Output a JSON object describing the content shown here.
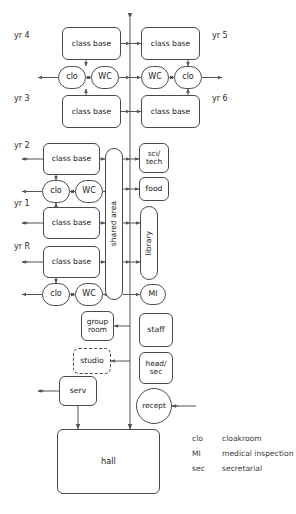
{
  "diagram": {
    "year_labels": [
      {
        "id": "yr4",
        "text": "yr 4",
        "x": 14,
        "y": 31
      },
      {
        "id": "yr3",
        "text": "yr 3",
        "x": 14,
        "y": 94
      },
      {
        "id": "yr2",
        "text": "yr 2",
        "x": 14,
        "y": 141
      },
      {
        "id": "yr1",
        "text": "yr 1",
        "x": 14,
        "y": 199
      },
      {
        "id": "yrR",
        "text": "yr R",
        "x": 14,
        "y": 242
      },
      {
        "id": "yr5",
        "text": "yr 5",
        "x": 212,
        "y": 31
      },
      {
        "id": "yr6",
        "text": "yr 6",
        "x": 212,
        "y": 94
      }
    ],
    "nodes": [
      {
        "id": "classbase-yr4",
        "label": "class base",
        "shape": "rect",
        "x": 62,
        "y": 27,
        "w": 59,
        "h": 33,
        "font": 7.6
      },
      {
        "id": "classbase-yr5",
        "label": "class base",
        "shape": "rect",
        "x": 141,
        "y": 27,
        "w": 59,
        "h": 33,
        "font": 7.6
      },
      {
        "id": "clo-yr4",
        "label": "clo",
        "shape": "pill",
        "x": 58,
        "y": 66,
        "w": 28,
        "h": 23,
        "font": 8
      },
      {
        "id": "wc-left-top",
        "label": "WC",
        "shape": "pill",
        "x": 91,
        "y": 66,
        "w": 28,
        "h": 23,
        "font": 8
      },
      {
        "id": "wc-right-top",
        "label": "WC",
        "shape": "pill",
        "x": 141,
        "y": 66,
        "w": 28,
        "h": 23,
        "font": 8
      },
      {
        "id": "clo-yr5",
        "label": "clo",
        "shape": "pill",
        "x": 174,
        "y": 66,
        "w": 28,
        "h": 23,
        "font": 8
      },
      {
        "id": "classbase-yr3",
        "label": "class base",
        "shape": "rect",
        "x": 62,
        "y": 95,
        "w": 59,
        "h": 33,
        "font": 7.6
      },
      {
        "id": "classbase-yr6",
        "label": "class base",
        "shape": "rect",
        "x": 141,
        "y": 95,
        "w": 59,
        "h": 33,
        "font": 7.6
      },
      {
        "id": "classbase-yr2",
        "label": "class base",
        "shape": "rect",
        "x": 43,
        "y": 143,
        "w": 57,
        "h": 32,
        "font": 7.6
      },
      {
        "id": "clo-yr2",
        "label": "clo",
        "shape": "pill",
        "x": 42,
        "y": 180,
        "w": 28,
        "h": 23,
        "font": 8
      },
      {
        "id": "wc-yr2",
        "label": "WC",
        "shape": "pill",
        "x": 75,
        "y": 180,
        "w": 28,
        "h": 23,
        "font": 8
      },
      {
        "id": "classbase-yr1",
        "label": "class base",
        "shape": "rect",
        "x": 43,
        "y": 207,
        "w": 57,
        "h": 32,
        "font": 7.6
      },
      {
        "id": "classbase-yrR",
        "label": "class base",
        "shape": "rect",
        "x": 43,
        "y": 246,
        "w": 57,
        "h": 32,
        "font": 7.6
      },
      {
        "id": "clo-yrR",
        "label": "clo",
        "shape": "pill",
        "x": 42,
        "y": 283,
        "w": 28,
        "h": 23,
        "font": 8
      },
      {
        "id": "wc-yrR",
        "label": "WC",
        "shape": "pill",
        "x": 75,
        "y": 283,
        "w": 28,
        "h": 23,
        "font": 8
      },
      {
        "id": "shared-area",
        "label": "shared area",
        "shape": "pill",
        "x": 105,
        "y": 148,
        "w": 18,
        "h": 152,
        "font": 7.6,
        "vertical": true
      },
      {
        "id": "sci-tech",
        "label": "sci/\ntech",
        "shape": "rect",
        "x": 139,
        "y": 143,
        "w": 30,
        "h": 30,
        "font": 7.4
      },
      {
        "id": "food",
        "label": "food",
        "shape": "rect",
        "x": 139,
        "y": 177,
        "w": 30,
        "h": 24,
        "font": 7.6
      },
      {
        "id": "library",
        "label": "library",
        "shape": "pill",
        "x": 140,
        "y": 206,
        "w": 18,
        "h": 74,
        "font": 7.6,
        "vertical": true
      },
      {
        "id": "mi",
        "label": "MI",
        "shape": "pill",
        "x": 140,
        "y": 284,
        "w": 26,
        "h": 21,
        "font": 7.8
      },
      {
        "id": "group-room",
        "label": "group\nroom",
        "shape": "rect",
        "x": 81,
        "y": 311,
        "w": 33,
        "h": 30,
        "font": 7.4
      },
      {
        "id": "staff",
        "label": "staff",
        "shape": "rect",
        "x": 139,
        "y": 313,
        "w": 34,
        "h": 34,
        "font": 7.8
      },
      {
        "id": "studio",
        "label": "studio",
        "shape": "dash",
        "x": 73,
        "y": 348,
        "w": 38,
        "h": 26,
        "font": 7.6
      },
      {
        "id": "head-sec",
        "label": "head/\nsec",
        "shape": "rect",
        "x": 139,
        "y": 352,
        "w": 34,
        "h": 32,
        "font": 7.4
      },
      {
        "id": "serv",
        "label": "serv",
        "shape": "rect",
        "x": 59,
        "y": 376,
        "w": 38,
        "h": 30,
        "font": 7.8
      },
      {
        "id": "recept",
        "label": "recept",
        "shape": "circle",
        "x": 136,
        "y": 388,
        "w": 36,
        "h": 36,
        "font": 7.4
      },
      {
        "id": "hall",
        "label": "hall",
        "shape": "rect",
        "x": 57,
        "y": 429,
        "w": 103,
        "h": 65,
        "font": 8.2
      }
    ],
    "legend": {
      "rows": [
        {
          "key": "clo",
          "value": "cloakroom"
        },
        {
          "key": "MI",
          "value": "medical inspection"
        },
        {
          "key": "sec",
          "value": "secretarial"
        }
      ],
      "x_key": 192,
      "x_value": 222,
      "y_start": 434,
      "row_height": 15
    },
    "colors": {
      "stroke": "#4a4a4a",
      "line": "#555555",
      "text": "#1a1a1a",
      "background": "#ffffff"
    }
  }
}
